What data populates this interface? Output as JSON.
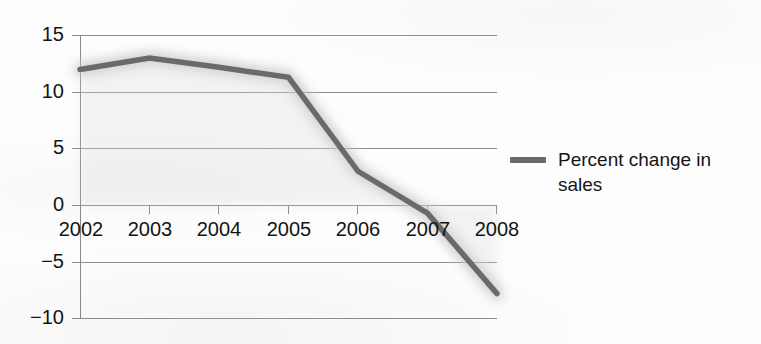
{
  "chart_data": {
    "type": "line",
    "title": "",
    "subtitle": "",
    "xlabel": "",
    "ylabel": "",
    "categories": [
      "2002",
      "2003",
      "2004",
      "2005",
      "2006",
      "2007",
      "2008"
    ],
    "x": [
      2002,
      2003,
      2004,
      2005,
      2006,
      2007,
      2008
    ],
    "series": [
      {
        "name": "Percent change in sales",
        "values": [
          12,
          13,
          12.2,
          11.3,
          3,
          -0.7,
          -7.8
        ],
        "color": "#6b6b6b"
      }
    ],
    "ylim": [
      -10,
      15
    ],
    "yticks": [
      15,
      10,
      5,
      0,
      -5,
      -10
    ],
    "ytick_labels": [
      "15",
      "10",
      "5",
      "0",
      "−5",
      "−10"
    ],
    "xticks": [
      2002,
      2003,
      2004,
      2005,
      2006,
      2007,
      2008
    ],
    "xtick_labels": [
      "2002",
      "2003",
      "2004",
      "2005",
      "2006",
      "2007",
      "2008"
    ],
    "xtick_labels_baseline_value": 0,
    "grid": true,
    "grid_axis": "y",
    "grid_color": "#8f8f8f",
    "axis_color": "#8a8a8a",
    "legend": {
      "position": "right",
      "entries": [
        {
          "label": "Percent change in sales",
          "label_line_1": "Percent change in",
          "label_line_2": "sales",
          "marker": "line-swatch",
          "color": "#6b6b6b"
        }
      ]
    }
  },
  "colors": {
    "background": "#fdfdfd",
    "series_line": "#6b6b6b",
    "series_halo": "#cfcfcf",
    "gridline": "#8f8f8f",
    "axis": "#8a8a8a",
    "text": "#141414"
  }
}
